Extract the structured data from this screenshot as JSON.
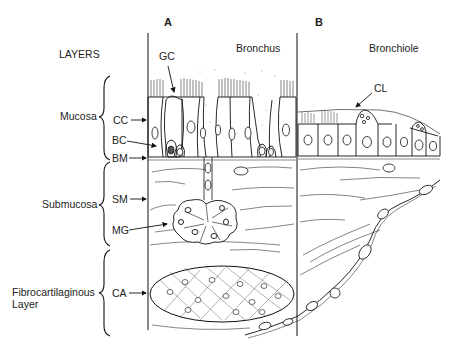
{
  "figure": {
    "panels": [
      {
        "letter": "A",
        "title": "Bronchus"
      },
      {
        "letter": "B",
        "title": "Bronchiole"
      }
    ],
    "layers_heading": "LAYERS",
    "layers": [
      {
        "name": "Mucosa"
      },
      {
        "name": "Submucosa"
      },
      {
        "name": "Fibrocartilaginous",
        "name_line2": "Layer"
      }
    ],
    "structure_labels": {
      "gc": "GC",
      "cc": "CC",
      "bc": "BC",
      "bm": "BM",
      "sm": "SM",
      "mg": "MG",
      "ca": "CA",
      "cl": "CL"
    }
  }
}
